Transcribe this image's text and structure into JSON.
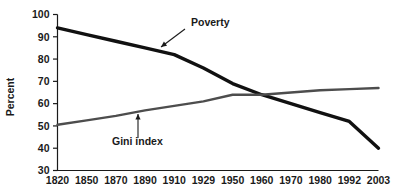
{
  "chart_data": {
    "type": "line",
    "title": "",
    "xlabel": "",
    "ylabel": "Percent",
    "ylim": [
      30,
      100
    ],
    "y_ticks": [
      30,
      40,
      50,
      60,
      70,
      80,
      90,
      100
    ],
    "grid": false,
    "legend_position": "inline-annotations",
    "categories": [
      "1820",
      "1850",
      "1870",
      "1890",
      "1910",
      "1929",
      "1950",
      "1960",
      "1970",
      "1980",
      "1992",
      "2003"
    ],
    "series": [
      {
        "name": "Poverty",
        "color": "#111111",
        "line_width": 3.4,
        "values": [
          94,
          91,
          88,
          85,
          82,
          76,
          69,
          64,
          60,
          56,
          52,
          40
        ]
      },
      {
        "name": "Gini index",
        "color": "#4d4d4d",
        "line_width": 2.4,
        "values": [
          50.5,
          52.5,
          54.5,
          57,
          59,
          61,
          64,
          64,
          65,
          66,
          66.5,
          67
        ]
      }
    ],
    "annotations": [
      {
        "text": "Poverty",
        "target_category": "1890",
        "target_value": 85,
        "label_x": 191,
        "label_y": 26,
        "arrow_from_x": 185,
        "arrow_from_y": 29,
        "arrow_to_x": 161,
        "arrow_to_y": 47
      },
      {
        "text": "Gini index",
        "target_category": "1870",
        "target_value": 54.5,
        "label_x": 112,
        "label_y": 145,
        "arrow_from_x": 138,
        "arrow_from_y": 138,
        "arrow_to_x": 138,
        "arrow_to_y": 114
      }
    ]
  }
}
